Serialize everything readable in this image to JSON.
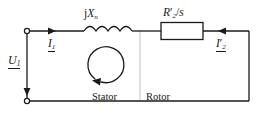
{
  "diagram": {
    "stroke_color": "#1a1a1a",
    "divider_color": "#b9b9b9",
    "background": "#ffffff"
  },
  "labels": {
    "reactance": {
      "prefix": "j",
      "symbol": "X",
      "subscript": "n",
      "full": "jXn"
    },
    "resistance": {
      "symbol": "R",
      "prime": "′",
      "subscript": "2",
      "divider": "/",
      "denominator": "s",
      "full": "R'2/s"
    },
    "source_voltage": {
      "symbol": "U",
      "subscript": "1",
      "full": "U1",
      "underlined": true
    },
    "stator_current": {
      "symbol": "I",
      "subscript": "1",
      "full": "I1",
      "underlined": true
    },
    "rotor_current": {
      "symbol": "I",
      "prime": "′",
      "subscript": "2",
      "full": "I'2",
      "underlined": true
    },
    "stator_region": "Stator",
    "rotor_region": "Rotor"
  },
  "components": {
    "inductor": {
      "name": "series-reactance-coil",
      "loops": 4
    },
    "resistor": {
      "name": "rotor-resistance-box",
      "shape": "rectangle"
    },
    "terminal_top": {
      "name": "input-terminal-top",
      "shape": "circle"
    },
    "terminal_bottom": {
      "name": "input-terminal-bottom",
      "shape": "circle"
    },
    "loop_arrow": {
      "name": "mesh-current-loop",
      "direction": "counterclockwise"
    },
    "arrow_stator_current": {
      "direction": "right"
    },
    "arrow_rotor_current": {
      "direction": "left"
    },
    "arrow_voltage": {
      "direction": "down"
    }
  }
}
